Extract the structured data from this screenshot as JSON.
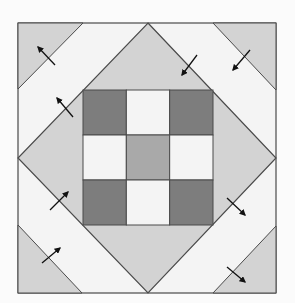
{
  "diagram": {
    "title": "",
    "type": "quilt-block",
    "colors": {
      "background": "#fbfbfb",
      "light_gray": "#d3d3d3",
      "white": "#f4f4f4",
      "dark_gray": "#7d7d7d",
      "medium_gray": "#a9a9a9",
      "line": "#4a4a4a",
      "arrow": "#111111"
    },
    "outer_square": {
      "x": 18,
      "y": 23,
      "w": 258,
      "h": 270
    },
    "diamond": {
      "top": [
        148,
        23
      ],
      "right": [
        276,
        158
      ],
      "bottom": [
        148,
        293
      ],
      "left": [
        18,
        158
      ]
    },
    "corner_triangles": [
      {
        "name": "top-left",
        "points": "18,23 83,23 18,89"
      },
      {
        "name": "top-right",
        "points": "213,23 276,23 276,90"
      },
      {
        "name": "bottom-left",
        "points": "18,225 82,293 18,293"
      },
      {
        "name": "bottom-right",
        "points": "276,226 276,293 213,293"
      }
    ],
    "nine_patch": {
      "x": 83,
      "y": 90,
      "w": 130,
      "h": 135,
      "cells": [
        "dark",
        "white",
        "dark",
        "white",
        "medium",
        "white",
        "dark",
        "white",
        "dark"
      ]
    },
    "arrows": [
      {
        "from": [
          55,
          65
        ],
        "to": [
          38,
          47
        ],
        "direction": "up-left"
      },
      {
        "from": [
          73,
          117
        ],
        "to": [
          57,
          98
        ],
        "direction": "up-left"
      },
      {
        "from": [
          197,
          55
        ],
        "to": [
          182,
          75
        ],
        "direction": "down-left"
      },
      {
        "from": [
          250,
          50
        ],
        "to": [
          233,
          70
        ],
        "direction": "down-left"
      },
      {
        "from": [
          50,
          210
        ],
        "to": [
          68,
          192
        ],
        "direction": "up-right"
      },
      {
        "from": [
          42,
          263
        ],
        "to": [
          60,
          248
        ],
        "direction": "up-right"
      },
      {
        "from": [
          227,
          198
        ],
        "to": [
          245,
          215
        ],
        "direction": "down-right"
      },
      {
        "from": [
          227,
          267
        ],
        "to": [
          245,
          282
        ],
        "direction": "down-right"
      }
    ]
  }
}
